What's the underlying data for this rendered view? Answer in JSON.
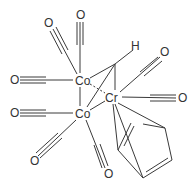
{
  "diagram": {
    "type": "chemical-structure",
    "colors": {
      "bond": "#3a3a3a",
      "label": "#333333",
      "background": "#ffffff"
    },
    "atoms": [
      {
        "id": "co1",
        "label": "Co",
        "x": 82,
        "y": 80
      },
      {
        "id": "co2",
        "label": "Co",
        "x": 82,
        "y": 113
      },
      {
        "id": "cr",
        "label": "Cr",
        "x": 112,
        "y": 97
      },
      {
        "id": "h",
        "label": "H",
        "x": 135,
        "y": 46
      },
      {
        "id": "o1",
        "label": "O",
        "x": 48,
        "y": 23
      },
      {
        "id": "o2",
        "label": "O",
        "x": 80,
        "y": 15
      },
      {
        "id": "o3",
        "label": "O",
        "x": 14,
        "y": 80
      },
      {
        "id": "o4",
        "label": "O",
        "x": 14,
        "y": 113
      },
      {
        "id": "o5",
        "label": "O",
        "x": 34,
        "y": 161
      },
      {
        "id": "o6",
        "label": "O",
        "x": 108,
        "y": 174
      },
      {
        "id": "o7",
        "label": "O",
        "x": 164,
        "y": 52
      },
      {
        "id": "o8",
        "label": "O",
        "x": 182,
        "y": 98
      }
    ]
  }
}
